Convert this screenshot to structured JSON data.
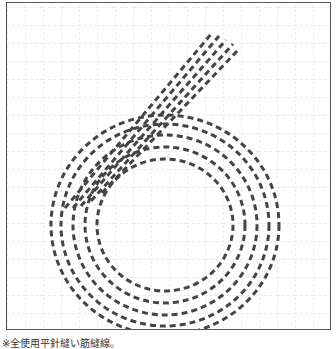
{
  "figure": {
    "grid": {
      "spacing_px": 18,
      "color": "#d8d8d8"
    },
    "stitch_color": "#444444",
    "frame_color": "#555555",
    "rows": 5
  },
  "caption": "※全使用平針縫い筋縫線。"
}
